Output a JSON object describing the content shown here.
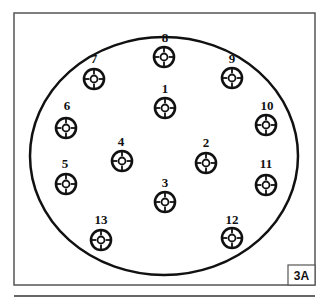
{
  "figure": {
    "id_label": "3A",
    "frame": {
      "x": 14,
      "y": 13,
      "width": 301,
      "height": 272,
      "color": "#555555"
    },
    "bottom_rule": {
      "y": 296,
      "x1": 14,
      "x2": 315,
      "color": "#333333"
    },
    "outer_circle": {
      "cx": 164,
      "cy": 156,
      "rx": 134,
      "ry": 119,
      "stroke": "#111111",
      "stroke_width": 2.5
    }
  },
  "targets": [
    {
      "num": "1",
      "label_x": 165,
      "label_y": 93,
      "cx": 165,
      "cy": 108
    },
    {
      "num": "2",
      "label_x": 206,
      "label_y": 147,
      "cx": 206,
      "cy": 163
    },
    {
      "num": "3",
      "label_x": 165,
      "label_y": 187,
      "cx": 165,
      "cy": 202
    },
    {
      "num": "4",
      "label_x": 121,
      "label_y": 146,
      "cx": 122,
      "cy": 161
    },
    {
      "num": "5",
      "label_x": 65,
      "label_y": 168,
      "cx": 66,
      "cy": 184
    },
    {
      "num": "6",
      "label_x": 67,
      "label_y": 110,
      "cx": 66,
      "cy": 128
    },
    {
      "num": "7",
      "label_x": 94,
      "label_y": 63,
      "cx": 94,
      "cy": 79
    },
    {
      "num": "8",
      "label_x": 165,
      "label_y": 42,
      "cx": 164,
      "cy": 57
    },
    {
      "num": "9",
      "label_x": 232,
      "label_y": 63,
      "cx": 232,
      "cy": 78
    },
    {
      "num": "10",
      "label_x": 267,
      "label_y": 110,
      "cx": 266,
      "cy": 125
    },
    {
      "num": "11",
      "label_x": 266,
      "label_y": 168,
      "cx": 266,
      "cy": 185
    },
    {
      "num": "12",
      "label_x": 232,
      "label_y": 224,
      "cx": 232,
      "cy": 238
    },
    {
      "num": "13",
      "label_x": 101,
      "label_y": 224,
      "cx": 101,
      "cy": 240
    }
  ],
  "target_style": {
    "outer_r": 10,
    "inner_r": 3.5,
    "stroke": "#111111"
  }
}
